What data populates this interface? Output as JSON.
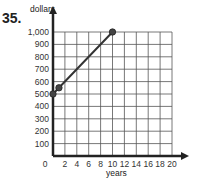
{
  "problem_number": "35.",
  "chart_data": {
    "type": "line",
    "title": "",
    "xlabel": "years",
    "ylabel": "dollars",
    "xlim": [
      0,
      20
    ],
    "ylim": [
      0,
      1000
    ],
    "x_ticks": [
      "0",
      "2",
      "4",
      "6",
      "8",
      "10",
      "12",
      "14",
      "16",
      "18",
      "20"
    ],
    "y_ticks": [
      "100",
      "200",
      "300",
      "400",
      "500",
      "600",
      "700",
      "800",
      "900",
      "1,000"
    ],
    "grid": true,
    "series": [
      {
        "name": "line",
        "x": [
          0,
          1,
          10
        ],
        "y": [
          500,
          550,
          1000
        ]
      }
    ],
    "marked_points": [
      [
        0,
        500
      ],
      [
        1,
        550
      ],
      [
        10,
        1000
      ]
    ]
  },
  "colors": {
    "line": "#333333",
    "grid": "#555555",
    "axis": "#222222"
  }
}
